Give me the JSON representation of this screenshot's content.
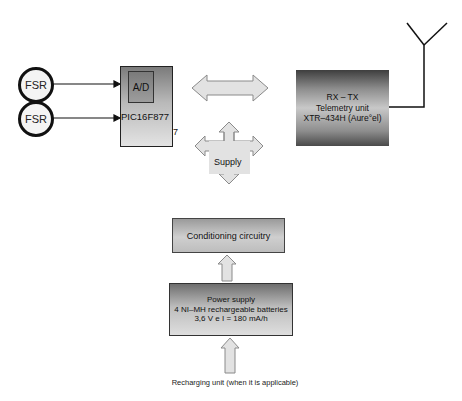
{
  "diagram": {
    "sensors": [
      {
        "label": "FSR"
      },
      {
        "label": "FSR"
      }
    ],
    "microcontroller": {
      "adc_label": "A/D",
      "label": "PIC16F877",
      "stray_char": "7"
    },
    "telemetry": {
      "lines": [
        "RX – TX",
        "Telemetry unit",
        "XTR–434H (Aure°el)"
      ]
    },
    "supply": {
      "label": "Supply"
    },
    "conditioning": {
      "label": "Conditioning circuitry"
    },
    "power": {
      "lines": [
        "Power supply",
        "4 NI–MH rechargeable batteries",
        "3,6 V e I = 180 mA/h"
      ]
    },
    "recharging": {
      "label": "Recharging unit (when it is applicable)"
    },
    "colors": {
      "arrow_fill": "#e2e2e2",
      "arrow_stroke": "#8a8a8a",
      "line": "#111111"
    }
  }
}
